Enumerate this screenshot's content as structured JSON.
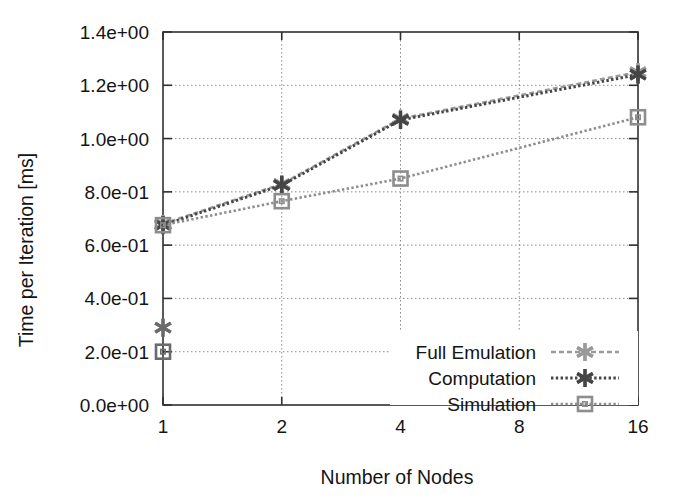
{
  "chart_data": {
    "type": "line",
    "title": "",
    "xlabel": "Number of Nodes",
    "ylabel": "Time per Iteration [ms]",
    "x_scale": "log2",
    "xlim": [
      1,
      16
    ],
    "ylim": [
      0.0,
      1.4
    ],
    "xticks": [
      1,
      2,
      4,
      8,
      16
    ],
    "xtick_labels": [
      "1",
      "2",
      "4",
      "8",
      "16"
    ],
    "yticks": [
      0.0,
      0.2,
      0.4,
      0.6,
      0.8,
      1.0,
      1.2,
      1.4
    ],
    "ytick_labels": [
      "0.0e+00",
      "2.0e-01",
      "4.0e-01",
      "6.0e-01",
      "8.0e-01",
      "1.0e+00",
      "1.2e+00",
      "1.4e+00"
    ],
    "grid": true,
    "grid_style": "dotted",
    "legend_position": "bottom-right",
    "series": [
      {
        "name": "Full Emulation",
        "marker": "star-x",
        "color": "#9a9a9a",
        "linestyle": "dashed",
        "x": [
          1,
          2,
          4,
          16
        ],
        "values": [
          0.675,
          0.825,
          1.07,
          1.245
        ]
      },
      {
        "name": "Computation",
        "marker": "star-x",
        "color": "#454545",
        "linestyle": "dotted",
        "x": [
          1,
          2,
          4,
          16
        ],
        "values": [
          0.675,
          0.825,
          1.07,
          1.24
        ]
      },
      {
        "name": "Simulation",
        "marker": "open-square",
        "color": "#8d8d8d",
        "linestyle": "dotted",
        "x": [
          1,
          2,
          4,
          16
        ],
        "values": [
          0.675,
          0.765,
          0.85,
          1.08
        ]
      }
    ],
    "extra_points": [
      {
        "series": "Computation",
        "x": 1,
        "y": 0.29,
        "marker": "star-x",
        "color": "#6a6a6a"
      },
      {
        "series": "Simulation",
        "x": 1,
        "y": 0.2,
        "marker": "open-square",
        "color": "#6a6a6a"
      }
    ],
    "annotations": []
  },
  "legend": {
    "entries": [
      {
        "label": "Full Emulation"
      },
      {
        "label": "Computation"
      },
      {
        "label": "Simulation"
      }
    ]
  },
  "axes": {
    "y_title": "Time per Iteration [ms]",
    "x_title": "Number of Nodes"
  }
}
